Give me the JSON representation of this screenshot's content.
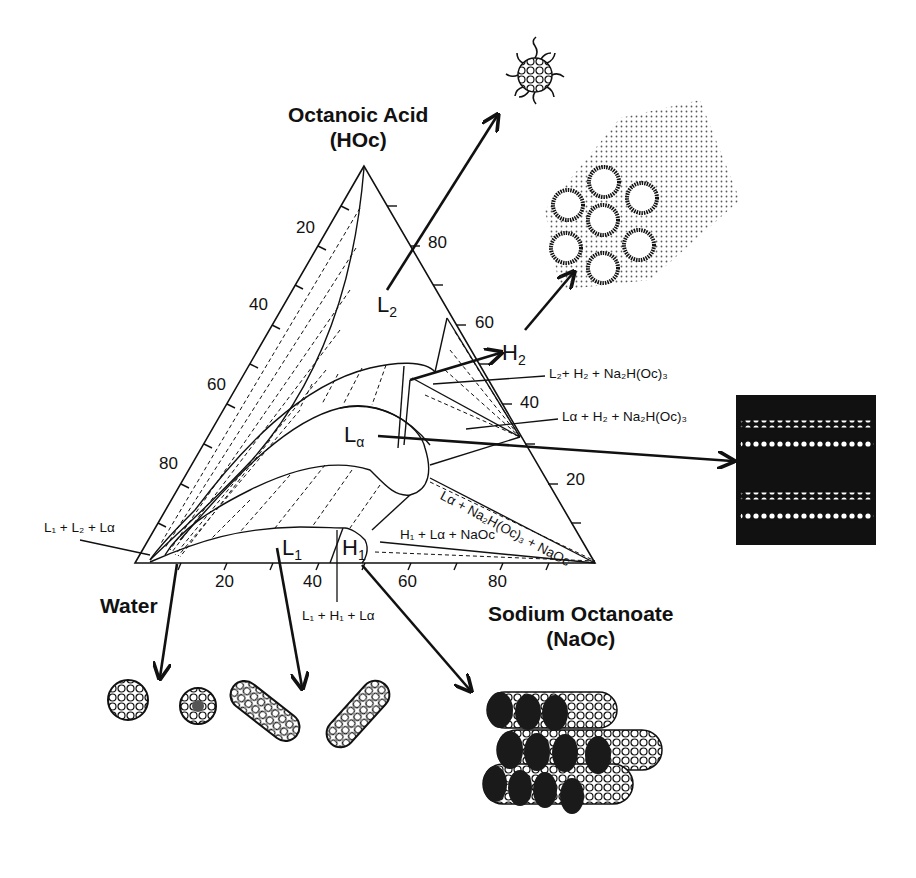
{
  "diagram": {
    "type": "ternary-phase-diagram",
    "vertices": {
      "top": {
        "name": "Octanoic Acid",
        "abbr": "(HOc)"
      },
      "bottom_left": {
        "name": "Water"
      },
      "bottom_right": {
        "name": "Sodium Octanoate",
        "abbr": "(NaOc)"
      }
    },
    "ticks": {
      "left_edge": [
        "20",
        "40",
        "60",
        "80"
      ],
      "right_edge": [
        "80",
        "60",
        "40",
        "20"
      ],
      "bottom_edge": [
        "20",
        "40",
        "60",
        "80"
      ]
    },
    "phases": {
      "L2": {
        "main": "L",
        "sub": "2"
      },
      "H2": {
        "main": "H",
        "sub": "2"
      },
      "La": {
        "main": "L",
        "sub": "α"
      },
      "L1": {
        "main": "L",
        "sub": "1"
      },
      "H1": {
        "main": "H",
        "sub": "1"
      }
    },
    "region_labels": [
      "L₂+ H₂ + Na₂H(Oc)₃",
      "Lα + H₂ + Na₂H(Oc)₃",
      "Lα + Na₂H(Oc)₃ + NaOc",
      "H₁ + Lα + NaOc",
      "L₁ + L₂ + Lα",
      "L₁ + H₁ + Lα"
    ],
    "illustrations": [
      "reverse-micelle",
      "reverse-hexagonal-cylinders",
      "lamellar-bilayers",
      "spherical-micelles",
      "rod-micelles",
      "hexagonal-cylinders"
    ]
  }
}
